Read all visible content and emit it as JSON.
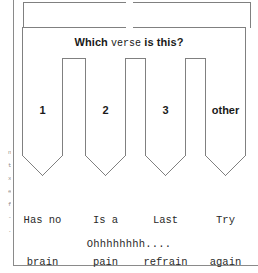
{
  "diagram": {
    "question": {
      "prefix": "Which ",
      "emphasis": "verse",
      "suffix": " is this?"
    },
    "branches": [
      {
        "label": "1",
        "outcome_line1": "Has no",
        "outcome_line2": "brain"
      },
      {
        "label": "2",
        "outcome_line1": "Is a",
        "outcome_line2": "pain"
      },
      {
        "label": "3",
        "outcome_line1": "Last",
        "outcome_line2": "refrain"
      },
      {
        "label": "other",
        "outcome_line1": "Try",
        "outcome_line2": "again"
      }
    ],
    "footer_note": "Ohhhhhhhh....",
    "margin_bleed": "n\nt\nx\ne\nf\n-\n."
  },
  "colors": {
    "stroke": "#808080",
    "frame": "#8a8a8a",
    "text": "#1a1a1a",
    "mono_text": "#2a2a2a",
    "background": "#ffffff"
  }
}
